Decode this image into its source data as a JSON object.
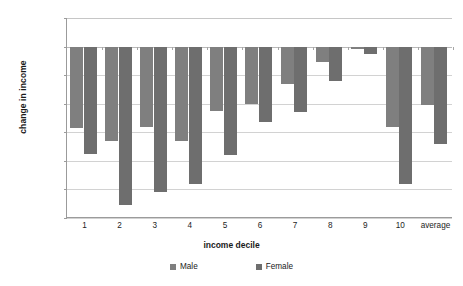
{
  "chart_data": {
    "type": "bar",
    "title": "",
    "xlabel": "income decile",
    "ylabel": "change in income",
    "categories": [
      "1",
      "2",
      "3",
      "4",
      "5",
      "6",
      "7",
      "8",
      "9",
      "10",
      "average"
    ],
    "series": [
      {
        "name": "Male",
        "color": "#7f7f7f",
        "values": [
          -285,
          -330,
          -280,
          -330,
          -225,
          -200,
          -130,
          -55,
          -8,
          -280,
          -205
        ]
      },
      {
        "name": "Female",
        "color": "#6e6e6e",
        "values": [
          -375,
          -555,
          -510,
          -480,
          -378,
          -265,
          -230,
          -120,
          -25,
          -480,
          -340
        ]
      }
    ],
    "ylim": [
      -600,
      100
    ],
    "ytick_values": [
      100,
      0,
      -100,
      -200,
      -300,
      -400,
      -500,
      -600
    ],
    "ytick_labels": [
      "£100",
      "£0",
      "-£100",
      "-£200",
      "-£300",
      "-£400",
      "-£500",
      "-£600"
    ],
    "grid": true,
    "legend_position": "bottom",
    "currency_symbol": "£"
  },
  "legend": {
    "items": [
      {
        "label": "Male"
      },
      {
        "label": "Female"
      }
    ]
  }
}
